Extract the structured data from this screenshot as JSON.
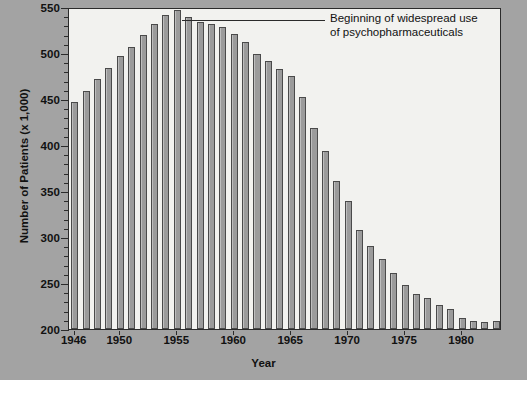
{
  "chart_data": {
    "type": "bar",
    "title": "",
    "xlabel": "Year",
    "ylabel": "Number of Patients (x 1,000)",
    "ylim": [
      200,
      550
    ],
    "xlim": [
      1945.5,
      1983.5
    ],
    "y_ticks": [
      200,
      250,
      300,
      350,
      400,
      450,
      500,
      550
    ],
    "y_minor_tick_step": 10,
    "x_ticks": [
      1946,
      1950,
      1955,
      1960,
      1965,
      1970,
      1975,
      1980
    ],
    "grid": false,
    "legend": null,
    "categories": [
      1946,
      1947,
      1948,
      1949,
      1950,
      1951,
      1952,
      1953,
      1954,
      1955,
      1956,
      1957,
      1958,
      1959,
      1960,
      1961,
      1962,
      1963,
      1964,
      1965,
      1966,
      1967,
      1968,
      1969,
      1970,
      1971,
      1972,
      1973,
      1974,
      1975,
      1976,
      1977,
      1978,
      1979,
      1980,
      1981,
      1982,
      1983
    ],
    "values": [
      447,
      459,
      472,
      484,
      497,
      506,
      520,
      531,
      541,
      547,
      539,
      534,
      531,
      528,
      521,
      512,
      499,
      491,
      483,
      475,
      452,
      419,
      394,
      361,
      339,
      308,
      290,
      276,
      261,
      248,
      238,
      234,
      226,
      222,
      212,
      209,
      208,
      209
    ],
    "annotations": [
      {
        "name": "psychopharmaceuticals-note",
        "line1": "Beginning of widespread use",
        "line2": "of psychopharmaceuticals",
        "points_to_year": 1955
      }
    ],
    "colors": {
      "bar_fill": "#9b9b9b",
      "bar_border": "#4a4a4a",
      "plot_background": "#f2f2ef",
      "figure_background": "#a3a3a3",
      "axis": "#2b2b2b",
      "text": "#111111"
    }
  }
}
